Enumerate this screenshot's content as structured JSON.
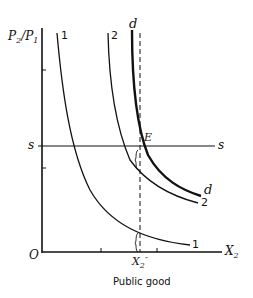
{
  "diagram": {
    "y_axis_label": "P2/P1",
    "y_axis_label_parts": {
      "p2": "P",
      "p2_sub": "2",
      "slash": "/",
      "p1": "P",
      "p1_sub": "1"
    },
    "x_axis_label": "X",
    "x_axis_label_sub": "2",
    "origin_label": "O",
    "supply_line_label_left": "s",
    "supply_line_label_right": "s",
    "equilibrium_label": "E",
    "quantity_label": "X",
    "quantity_label_sub": "2",
    "quantity_label_sup": "″",
    "caption": "Public good",
    "curves": [
      {
        "name": "1",
        "top_label": "1",
        "bottom_label": "1"
      },
      {
        "name": "2",
        "top_label": "2",
        "bottom_label": "2"
      },
      {
        "name": "d",
        "top_label": "d",
        "bottom_label": "d",
        "style": "thick"
      }
    ],
    "colors": {
      "ink": "#111111",
      "background": "#ffffff"
    }
  }
}
